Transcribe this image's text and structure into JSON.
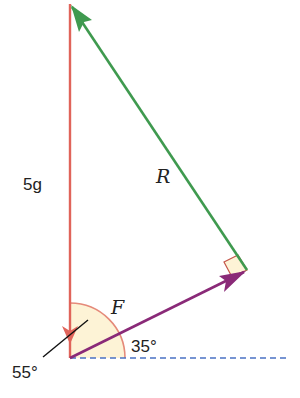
{
  "diagram": {
    "type": "force-triangle",
    "labels": {
      "weight": "5g",
      "resultant": "R",
      "force": "F",
      "angle_horizontal": "35°",
      "angle_vertical": "55°"
    },
    "colors": {
      "weight_vector": "#e0645a",
      "resultant_vector": "#3f9a4f",
      "force_vector": "#8a2a78",
      "horizontal_dashed": "#4a72c4",
      "angle_fill": "#fdf3d6",
      "angle_outline": "#e58a7a",
      "pointer_line": "#111111"
    },
    "vectors": [
      {
        "name": "weight",
        "label": "5g",
        "direction": "down",
        "color": "#e0645a"
      },
      {
        "name": "force",
        "label": "F",
        "angle_to_horizontal_deg": 35,
        "color": "#8a2a78"
      },
      {
        "name": "resultant",
        "label": "R",
        "direction": "up-left",
        "color": "#3f9a4f"
      }
    ],
    "right_angle_between": [
      "force",
      "resultant"
    ]
  }
}
